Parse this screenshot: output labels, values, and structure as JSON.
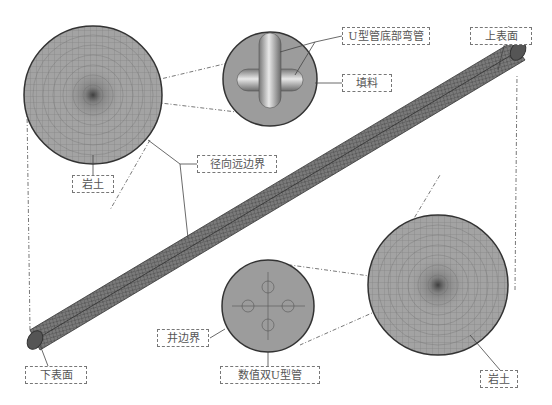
{
  "labels": {
    "u_pipe_bottom_bend": "U型管底部弯管",
    "fill": "填料",
    "top_surface": "上表面",
    "rock_soil_left": "岩土",
    "radial_far_boundary": "径向远边界",
    "well_boundary": "井边界",
    "bottom_surface": "下表面",
    "numerical_double_u_pipe": "数值双U型管",
    "rock_soil_right": "岩土"
  },
  "colors": {
    "mesh_fill": "#9a9a9a",
    "outline": "#333333",
    "label_border": "#777777",
    "text": "#555555"
  }
}
